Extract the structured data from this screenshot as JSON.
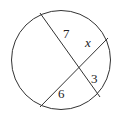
{
  "diagram": {
    "type": "intersecting-chords-in-circle",
    "circle": {
      "cx": 61,
      "cy": 60,
      "r": 50
    },
    "chords": [
      {
        "from": [
          40,
          13
        ],
        "to": [
          100,
          97
        ]
      },
      {
        "from": [
          108,
          38
        ],
        "to": [
          40,
          107
        ]
      }
    ],
    "labels": {
      "seg_a": "7",
      "seg_b": "x",
      "seg_c": "3",
      "seg_d": "6"
    },
    "stroke_color": "#333333"
  }
}
